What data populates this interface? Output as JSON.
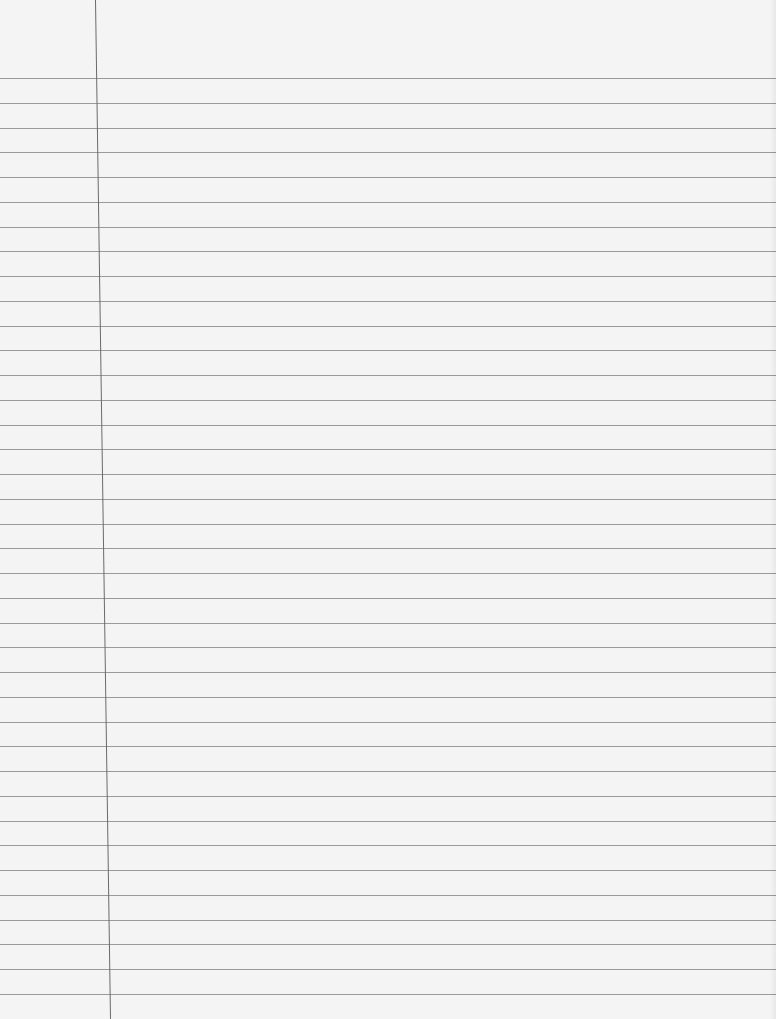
{
  "page": {
    "type": "lined-notebook-paper",
    "content": "",
    "line_count": 38,
    "first_line_y": 78,
    "line_spacing": 24.75,
    "margin_line_x_top": 95,
    "margin_line_x_bottom": 110,
    "colors": {
      "paper": "#f4f4f4",
      "rule": "#8a8a8a",
      "margin": "#6a6a6a"
    }
  }
}
